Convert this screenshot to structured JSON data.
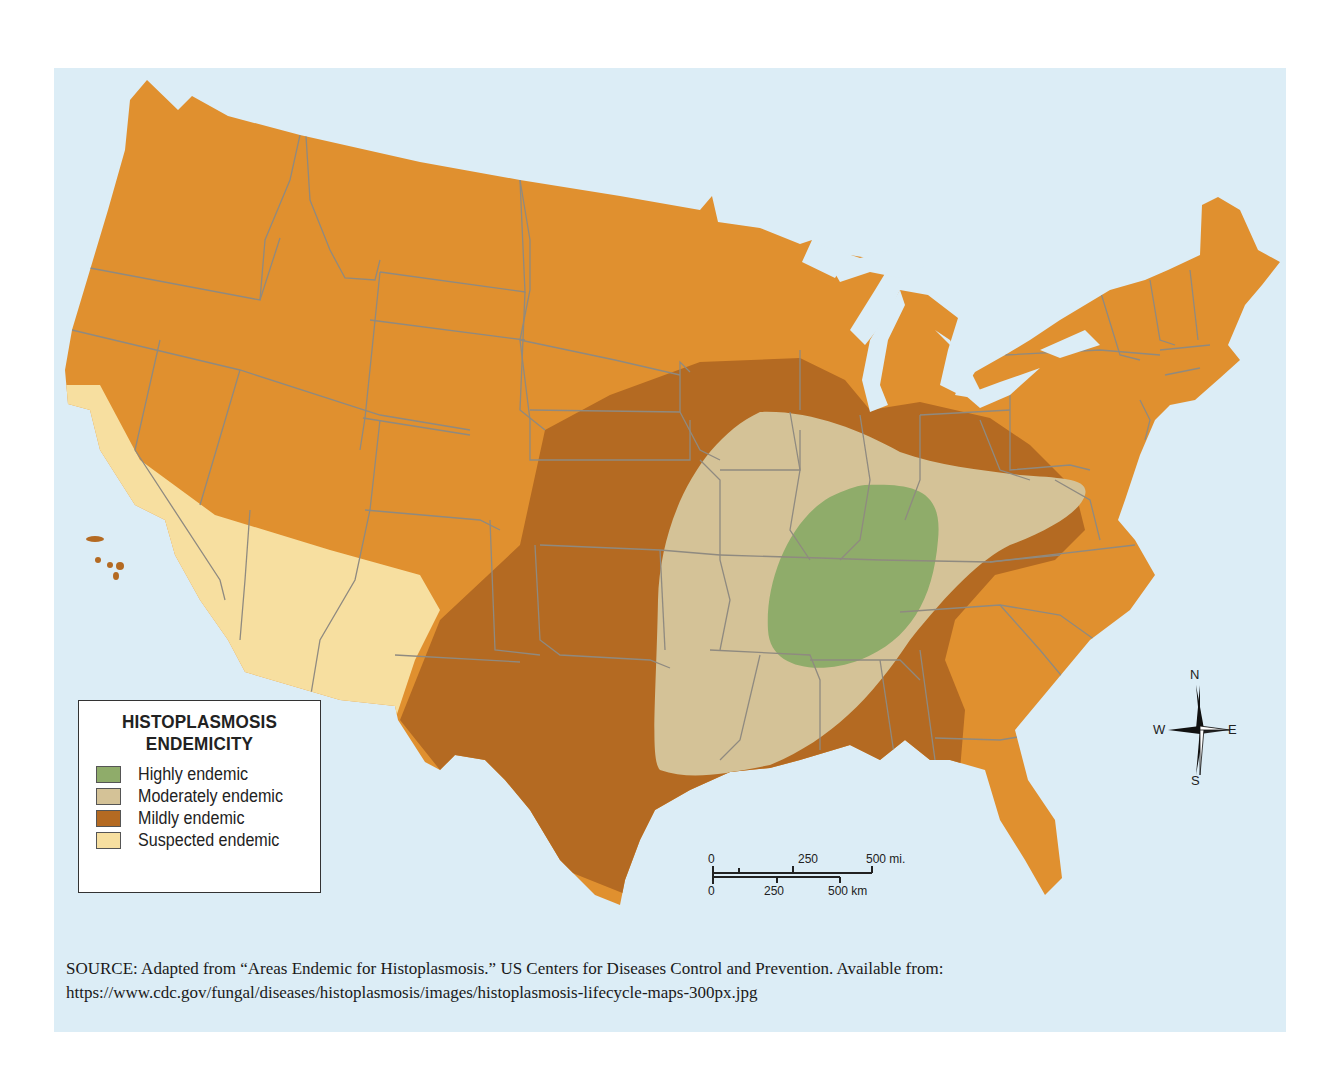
{
  "map": {
    "title": "HISTOPLASMOSIS ENDEMICITY",
    "region": "Contiguous United States",
    "colors": {
      "water": "#dcedf6",
      "not_endemic": "#e0902f",
      "highly_endemic": "#8fac6a",
      "moderately_endemic": "#d4c297",
      "mildly_endemic": "#b46a22",
      "suspected_endemic": "#f7dfa0",
      "state_border": "#8f8a80"
    }
  },
  "legend": {
    "title_line1": "HISTOPLASMOSIS",
    "title_line2": "ENDEMICITY",
    "items": [
      {
        "label": "Highly endemic",
        "color": "#8fac6a"
      },
      {
        "label": "Moderately endemic",
        "color": "#d4c297"
      },
      {
        "label": "Mildly endemic",
        "color": "#b46a22"
      },
      {
        "label": "Suspected endemic",
        "color": "#f7dfa0"
      }
    ]
  },
  "scale_bar": {
    "miles": {
      "start": "0",
      "mid": "250",
      "end": "500 mi."
    },
    "km": {
      "start": "0",
      "mid": "250",
      "end": "500 km"
    }
  },
  "compass": {
    "n": "N",
    "s": "S",
    "e": "E",
    "w": "W"
  },
  "source": {
    "label": "SOURCE",
    "text": ": Adapted from “Areas Endemic for Histoplasmosis.” US Centers for Diseases Control and Prevention. Available from:",
    "url": "https://www.cdc.gov/fungal/diseases/histoplasmosis/images/histoplasmosis-lifecycle-maps-300px.jpg"
  }
}
